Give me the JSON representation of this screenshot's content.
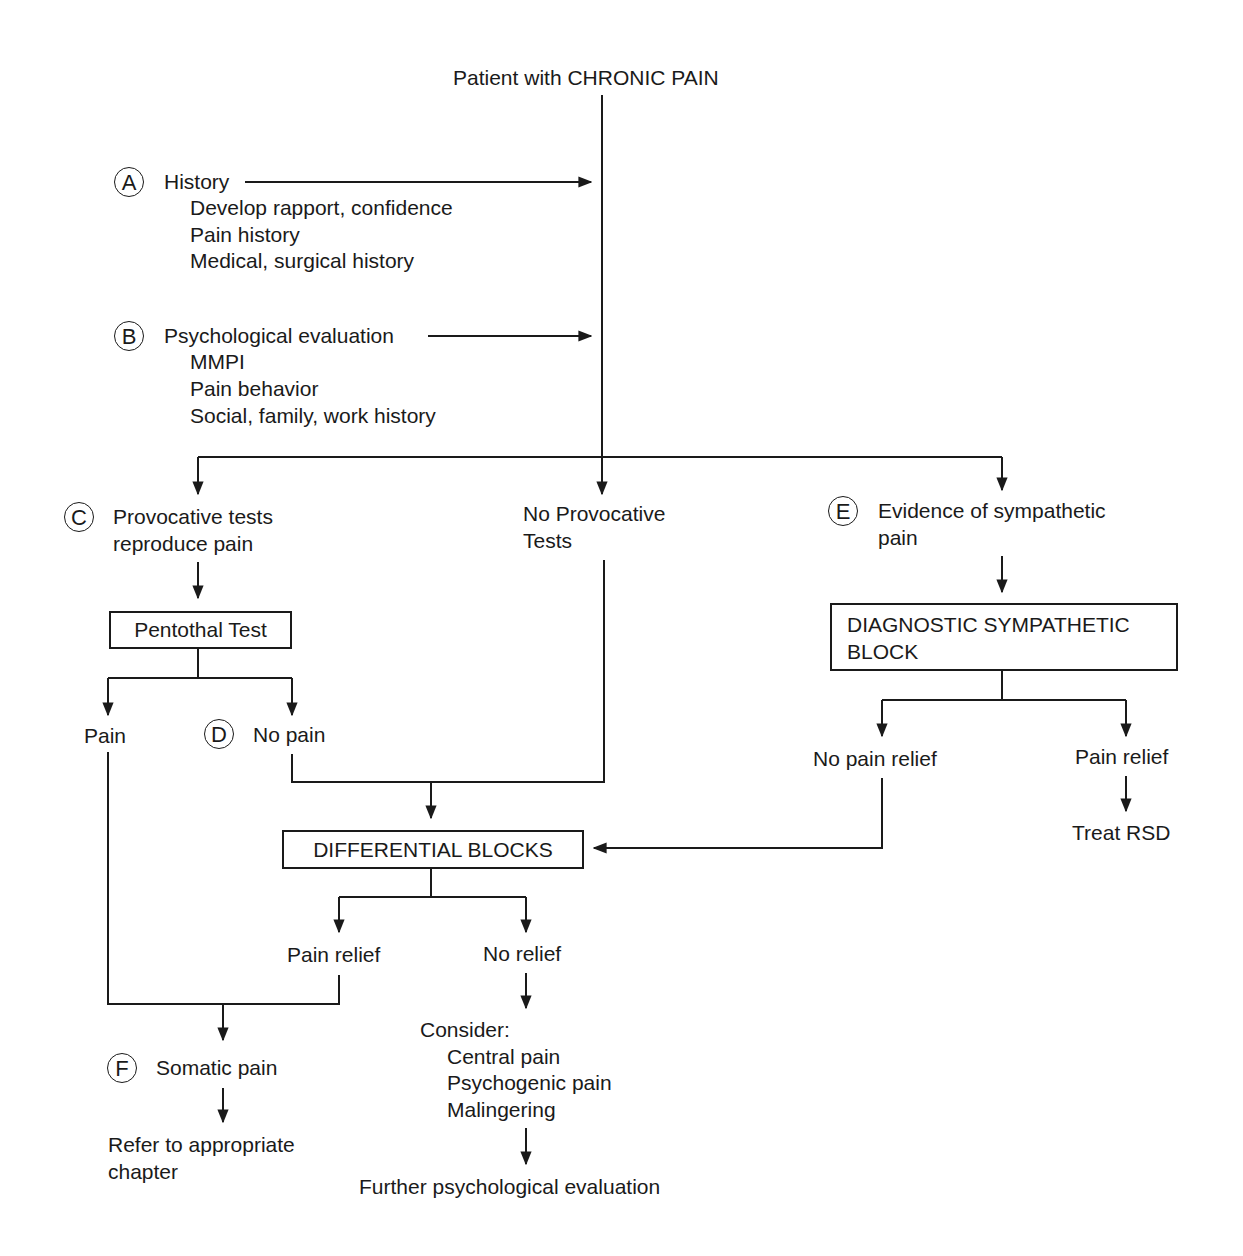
{
  "diagram": {
    "title": "Patient with CHRONIC PAIN",
    "steps": {
      "A": {
        "marker": "A",
        "heading": "History",
        "items": [
          "Develop rapport, confidence",
          "Pain history",
          "Medical, surgical history"
        ]
      },
      "B": {
        "marker": "B",
        "heading": "Psychological evaluation",
        "items": [
          "MMPI",
          "Pain behavior",
          "Social, family, work history"
        ]
      },
      "C": {
        "marker": "C",
        "line1": "Provocative tests",
        "line2": "reproduce pain"
      },
      "no_provocative": {
        "line1": "No Provocative",
        "line2": "Tests"
      },
      "E": {
        "marker": "E",
        "line1": "Evidence of sympathetic",
        "line2": "pain"
      },
      "pentothal": {
        "box_label": "Pentothal Test",
        "pain": "Pain",
        "D_marker": "D",
        "no_pain": "No pain"
      },
      "diagnostic_block": {
        "line1": "DIAGNOSTIC SYMPATHETIC",
        "line2": "BLOCK",
        "no_relief": "No pain relief",
        "relief": "Pain relief",
        "treat": "Treat RSD"
      },
      "differential": {
        "box_label": "DIFFERENTIAL BLOCKS",
        "relief": "Pain relief",
        "no_relief": "No relief"
      },
      "F": {
        "marker": "F",
        "heading": "Somatic pain",
        "refer_line1": "Refer to appropriate",
        "refer_line2": "chapter"
      },
      "consider": {
        "heading": "Consider:",
        "items": [
          "Central pain",
          "Psychogenic pain",
          "Malingering"
        ],
        "further": "Further psychological evaluation"
      }
    }
  }
}
